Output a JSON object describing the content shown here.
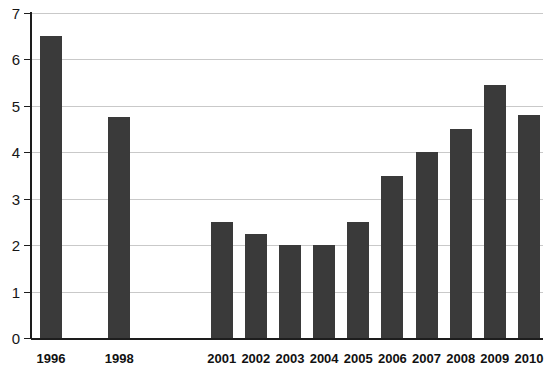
{
  "chart_data": {
    "type": "bar",
    "title": "",
    "subtitle": "",
    "xlabel": "",
    "ylabel": "",
    "categories": [
      "1996",
      "1998",
      "2001",
      "2002",
      "2003",
      "2004",
      "2005",
      "2006",
      "2007",
      "2008",
      "2009",
      "2010"
    ],
    "values": [
      6.5,
      4.75,
      2.5,
      2.25,
      2.0,
      2.0,
      2.5,
      3.5,
      4.0,
      4.5,
      5.45,
      4.8
    ],
    "ylim": [
      0,
      7
    ],
    "ytick_labels": [
      "0",
      "1",
      "2",
      "3",
      "4",
      "5",
      "6",
      "7"
    ],
    "ytick_values": [
      0,
      1,
      2,
      3,
      4,
      5,
      6,
      7
    ],
    "grid": true,
    "grid_axis": "y",
    "legend": null,
    "legend_position": "none",
    "annotations": [],
    "missing_categories": [
      "1997",
      "1999",
      "2000"
    ],
    "colors": {
      "bar": "#3a3a3a",
      "gridline": "#c9c9c9",
      "axis": "#1d1d1d",
      "background": "#ffffff",
      "tick_label": "#161616"
    }
  }
}
